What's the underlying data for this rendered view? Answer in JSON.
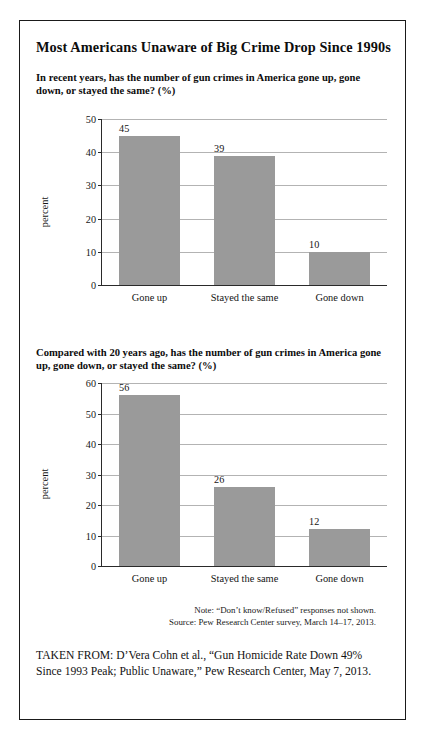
{
  "figure": {
    "title": "Most Americans Unaware of Big Crime Drop Since 1990s",
    "note": "Note: “Don’t know/Refused” responses not shown.",
    "source": "Source: Pew Research Center survey, March 14–17, 2013.",
    "taken_from": "TAKEN FROM: D’Vera Cohn et al., “Gun Homicide Rate Down 49% Since 1993 Peak; Public Unaware,” Pew Research Center, May 7, 2013.",
    "bar_color": "#9a9a9a",
    "gridline_color": "#b3b3b3",
    "axis_color": "#2a2a2a",
    "border_color": "#1a1a1a"
  },
  "chart_data": [
    {
      "type": "bar",
      "title": "In recent years, has the number of gun crimes in America gone up, gone down, or stayed the same? (%)",
      "categories": [
        "Gone up",
        "Stayed the same",
        "Gone down"
      ],
      "values": [
        45,
        39,
        10
      ],
      "xlabel": "",
      "ylabel": "percent",
      "ylim": [
        0,
        50
      ],
      "yticks": [
        0,
        10,
        20,
        30,
        40,
        50
      ],
      "grid": true,
      "legend": "none"
    },
    {
      "type": "bar",
      "title": "Compared with 20 years ago, has the number of gun crimes in America gone up, gone down, or stayed the same? (%)",
      "categories": [
        "Gone up",
        "Stayed the same",
        "Gone down"
      ],
      "values": [
        56,
        26,
        12
      ],
      "xlabel": "",
      "ylabel": "percent",
      "ylim": [
        0,
        60
      ],
      "yticks": [
        0,
        10,
        20,
        30,
        40,
        50,
        60
      ],
      "grid": true,
      "legend": "none"
    }
  ]
}
